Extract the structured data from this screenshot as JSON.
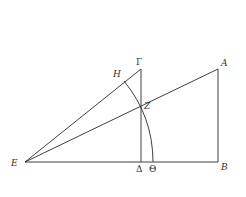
{
  "diagram": {
    "type": "geometric-figure",
    "labels": {
      "A": "A",
      "B": "B",
      "Gamma": "Γ",
      "Delta": "Δ",
      "E": "E",
      "Z": "Z",
      "H": "H",
      "Theta": "Θ"
    },
    "points": {
      "E": [
        25,
        162
      ],
      "Delta": [
        141,
        162
      ],
      "Theta": [
        153,
        162
      ],
      "B": [
        218,
        162
      ],
      "Gamma": [
        141,
        69
      ],
      "A": [
        218,
        69
      ],
      "H": [
        124,
        81
      ],
      "Z": [
        141,
        106
      ]
    },
    "segments": [
      [
        "E",
        "B"
      ],
      [
        "E",
        "Gamma"
      ],
      [
        "E",
        "A"
      ],
      [
        "Gamma",
        "Delta"
      ],
      [
        "A",
        "B"
      ]
    ],
    "arcs": [
      {
        "center": "E",
        "from": "H",
        "to": "Theta",
        "through": "Z"
      }
    ],
    "colors": {
      "stroke": "#2a2a2a",
      "label": "#333333",
      "background": "#ffffff"
    }
  }
}
